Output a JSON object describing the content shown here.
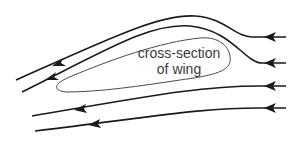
{
  "diagram": {
    "wing_label": {
      "line1": "cross-section",
      "line2": "of wing"
    },
    "colors": {
      "streamline": "#1a1a1a",
      "wing_outline": "#4a4a4a",
      "text": "#3a3a3a",
      "background": "#ffffff"
    },
    "streamlines": [
      {
        "id": 1,
        "direction": "right-to-left",
        "shape": "curves over wing top"
      },
      {
        "id": 2,
        "direction": "right-to-left",
        "shape": "curves over wing top"
      },
      {
        "id": 3,
        "direction": "right-to-left",
        "shape": "nearly straight below wing"
      },
      {
        "id": 4,
        "direction": "right-to-left",
        "shape": "nearly straight below wing"
      }
    ]
  }
}
